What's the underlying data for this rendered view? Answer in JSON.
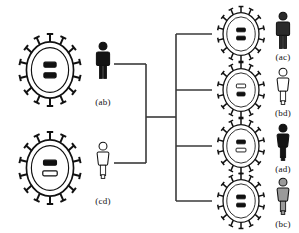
{
  "diagram": {
    "type": "cross-pedigree",
    "line_color": "#3a3a3a",
    "ink_color": "#111111"
  },
  "parents": [
    {
      "id": "parent-ab",
      "label": "(ab)",
      "cell_name": "spiked-cell-ab",
      "person_name": "male-figure-ab",
      "person_sex": "male",
      "person_fill": "#141414",
      "bands": [
        {
          "style": "filled",
          "width": 16
        },
        {
          "style": "filled",
          "width": 16
        }
      ],
      "x": 12,
      "y": 32,
      "cell_w": 76,
      "cell_h": 76,
      "person_x": 92,
      "person_y": 40,
      "label_x": 92,
      "label_y": 97
    },
    {
      "id": "parent-cd",
      "label": "(cd)",
      "cell_name": "spiked-cell-cd",
      "person_name": "female-figure-cd",
      "person_sex": "female",
      "person_fill": "#ffffff",
      "bands": [
        {
          "style": "filled",
          "width": 17
        },
        {
          "style": "outline",
          "width": 19
        }
      ],
      "x": 12,
      "y": 130,
      "cell_w": 76,
      "cell_h": 76,
      "person_x": 92,
      "person_y": 140,
      "label_x": 92,
      "label_y": 196
    }
  ],
  "offspring": [
    {
      "id": "child-ac",
      "label": "(ac)",
      "cell_name": "spiked-cell-ac",
      "person_name": "male-figure-ac",
      "person_sex": "male",
      "person_fill": "#2b2b2b",
      "bands": [
        {
          "style": "filled",
          "width": 15
        },
        {
          "style": "filled",
          "width": 15
        }
      ],
      "x": 212,
      "y": 5,
      "cell_w": 58,
      "cell_h": 58,
      "person_x": 272,
      "person_y": 10,
      "label_x": 272,
      "label_y": 52,
      "branch_y": 34
    },
    {
      "id": "child-bd",
      "label": "(bd)",
      "cell_name": "spiked-cell-bd",
      "person_name": "female-figure-bd",
      "person_sex": "female",
      "person_fill": "#ffffff",
      "bands": [
        {
          "style": "outline",
          "width": 16
        },
        {
          "style": "filled",
          "width": 14
        }
      ],
      "x": 212,
      "y": 61,
      "cell_w": 58,
      "cell_h": 58,
      "person_x": 272,
      "person_y": 66,
      "label_x": 272,
      "label_y": 108,
      "branch_y": 90
    },
    {
      "id": "child-ad",
      "label": "(ad)",
      "cell_name": "spiked-cell-ad",
      "person_name": "female-figure-ad",
      "person_sex": "female",
      "person_fill": "#141414",
      "bands": [
        {
          "style": "filled",
          "width": 15
        },
        {
          "style": "outline",
          "width": 17
        }
      ],
      "x": 212,
      "y": 117,
      "cell_w": 58,
      "cell_h": 58,
      "person_x": 272,
      "person_y": 122,
      "label_x": 272,
      "label_y": 164,
      "branch_y": 146
    },
    {
      "id": "child-bc",
      "label": "(bc)",
      "cell_name": "spiked-cell-bc",
      "person_name": "female-figure-bc",
      "person_sex": "female",
      "person_fill": "#9a9a9a",
      "bands": [
        {
          "style": "filled",
          "width": 15
        },
        {
          "style": "filled",
          "width": 15
        }
      ],
      "x": 212,
      "y": 172,
      "cell_w": 58,
      "cell_h": 58,
      "person_x": 272,
      "person_y": 176,
      "label_x": 272,
      "label_y": 219,
      "branch_y": 201
    }
  ],
  "connectors": {
    "parent_ab_stub": {
      "x1": 114,
      "y1": 64,
      "x2": 146,
      "y2": 64
    },
    "parent_cd_stub": {
      "x1": 114,
      "y1": 163,
      "x2": 146,
      "y2": 163
    },
    "parent_vertical": {
      "x": 146,
      "y1": 64,
      "y2": 163
    },
    "mating_line": {
      "x1": 146,
      "y1": 117,
      "x2": 176,
      "y2": 117
    },
    "sibship_vertical": {
      "x": 176,
      "y1": 34,
      "y2": 201
    },
    "child_stub_x2": 212
  }
}
